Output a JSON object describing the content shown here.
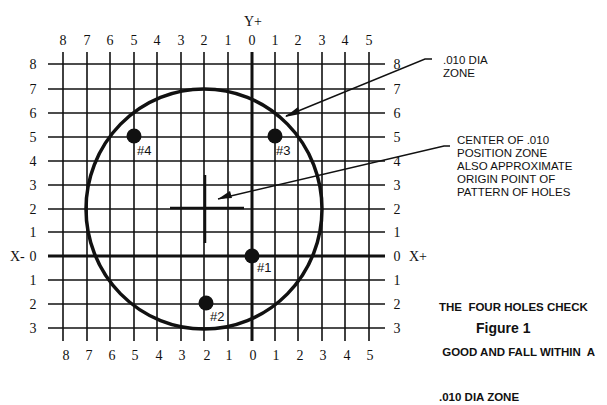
{
  "diagram": {
    "title": "Figure 1",
    "y_axis_label": "Y+",
    "x_neg_label": "X-",
    "x_pos_label": "X+",
    "top_ticks": [
      "8",
      "7",
      "6",
      "5",
      "4",
      "3",
      "2",
      "1",
      "0",
      "1",
      "2",
      "3",
      "4",
      "5"
    ],
    "bottom_ticks": [
      "8",
      "7",
      "6",
      "5",
      "4",
      "3",
      "2",
      "1",
      "0",
      "1",
      "2",
      "3",
      "4",
      "5"
    ],
    "left_ticks": [
      "8",
      "7",
      "6",
      "5",
      "4",
      "3",
      "2",
      "1",
      "0",
      "1",
      "2",
      "3"
    ],
    "right_ticks": [
      "8",
      "7",
      "6",
      "5",
      "4",
      "3",
      "2",
      "1",
      "0",
      "1",
      "2",
      "3"
    ],
    "grid": {
      "x_values": [
        -8,
        -7,
        -6,
        -5,
        -4,
        -3,
        -2,
        -1,
        0,
        1,
        2,
        3,
        4,
        5
      ],
      "y_values": [
        8,
        7,
        6,
        5,
        4,
        3,
        2,
        1,
        0,
        -1,
        -2,
        -3
      ]
    },
    "zone_circle": {
      "center": [
        -2,
        2
      ],
      "radius_units": 5
    },
    "crosshair": {
      "center": [
        -2,
        2
      ]
    },
    "holes": [
      {
        "label": "#1",
        "x": 0,
        "y": 0
      },
      {
        "label": "#2",
        "x": -2,
        "y": -2
      },
      {
        "label": "#3",
        "x": 1,
        "y": 5
      },
      {
        "label": "#4",
        "x": -5,
        "y": 5
      }
    ],
    "callouts": {
      "zone": {
        "line1": ".010 DIA",
        "line2": "ZONE"
      },
      "center": {
        "line1": "CENTER OF .010",
        "line2": "POSITION ZONE",
        "line3": "ALSO APPROXIMATE",
        "line4": "ORIGIN POINT OF",
        "line5": "PATTERN OF HOLES"
      }
    },
    "conclusion": {
      "line1": "THE  FOUR HOLES CHECK",
      "line2": " GOOD AND FALL WITHIN  A",
      "line3": ".010 DIA ZONE"
    }
  }
}
